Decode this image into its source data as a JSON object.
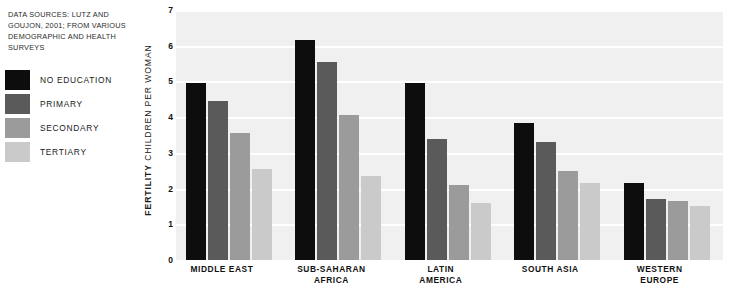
{
  "source_note": "DATA SOURCES: LUTZ AND GOUJON, 2001; FROM VARIOUS DEMOGRAPHIC AND HEALTH SURVEYS",
  "axis": {
    "ylabel_strong": "FERTILITY",
    "ylabel_rest": " CHILDREN PER WOMAN"
  },
  "legend": {
    "items": [
      {
        "label": "NO EDUCATION",
        "color": "#0d0d0d"
      },
      {
        "label": "PRIMARY",
        "color": "#5a5a5a"
      },
      {
        "label": "SECONDARY",
        "color": "#9b9b9b"
      },
      {
        "label": "TERTIARY",
        "color": "#cacaca"
      }
    ]
  },
  "chart_data": {
    "type": "bar",
    "title": "",
    "xlabel": "",
    "ylabel": "FERTILITY CHILDREN PER WOMAN",
    "ylim": [
      0,
      7
    ],
    "yticks": [
      0,
      1,
      2,
      3,
      4,
      5,
      6,
      7
    ],
    "ytick_labels": [
      "0",
      "1",
      "2",
      "3",
      "4",
      "5",
      "6",
      "7"
    ],
    "grid": "horizontal-white-on-light-gray",
    "legend_position": "outside-left",
    "categories": [
      "MIDDLE EAST",
      "SUB-SAHARAN AFRICA",
      "LATIN AMERICA",
      "SOUTH ASIA",
      "WESTERN EUROPE"
    ],
    "series": [
      {
        "name": "NO EDUCATION",
        "color": "#0d0d0d",
        "values": [
          4.95,
          6.15,
          4.95,
          3.85,
          2.15
        ]
      },
      {
        "name": "PRIMARY",
        "color": "#5a5a5a",
        "values": [
          4.45,
          5.55,
          3.4,
          3.3,
          1.7
        ]
      },
      {
        "name": "SECONDARY",
        "color": "#9b9b9b",
        "values": [
          3.55,
          4.05,
          2.1,
          2.5,
          1.65
        ]
      },
      {
        "name": "TERTIARY",
        "color": "#cacaca",
        "values": [
          2.55,
          2.35,
          1.6,
          2.15,
          1.5
        ]
      }
    ]
  },
  "category_lines": [
    [
      "MIDDLE EAST"
    ],
    [
      "SUB-SAHARAN",
      "AFRICA"
    ],
    [
      "LATIN",
      "AMERICA"
    ],
    [
      "SOUTH ASIA"
    ],
    [
      "WESTERN",
      "EUROPE"
    ]
  ]
}
